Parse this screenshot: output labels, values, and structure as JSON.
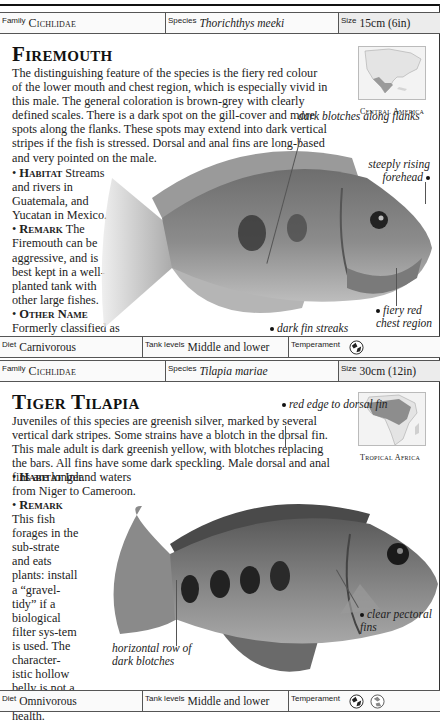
{
  "entries": [
    {
      "family_label": "Family",
      "family": "Cichlidae",
      "species_label": "Species",
      "species": "Thorichthys meeki",
      "size_label": "Size",
      "size": "15cm (6in)",
      "title": "Firemouth",
      "description": "The distinguishing feature of the species is the fiery red colour of the lower mouth and chest region, which is especially vivid in this male. The general coloration is brown-grey with clearly defined scales. There is a dark spot on the gill-cover and more spots along the flanks. These spots may extend into dark vertical stripes if the fish is stressed. Dorsal and anal fins are long-based and very pointed on the male.",
      "habitat_key": "Habitat",
      "habitat": "Streams and rivers in Guatemala, and Yucatan in Mexico.",
      "remark_key": "Remark",
      "remark": "The Firemouth can be aggressive, and is best kept in a well-planted tank with other large fishes.",
      "other_key": "Other Name",
      "other_text": "Formerly classified as",
      "other_name": "Cichlasoma meeki.",
      "map_region": "Central America",
      "callouts": [
        "dark blotches along flanks",
        "steeply rising forehead",
        "fiery red chest region",
        "dark fin streaks"
      ],
      "diet_label": "Diet",
      "diet": "Carnivorous",
      "tank_label": "Tank levels",
      "tank": "Middle and lower",
      "temperament_label": "Temperament",
      "temperament_icons": [
        "aggressive-fish-icon"
      ]
    },
    {
      "family_label": "Family",
      "family": "Cichlidae",
      "species_label": "Species",
      "species": "Tilapia mariae",
      "size_label": "Size",
      "size": "30cm (12in)",
      "title": "Tiger Tilapia",
      "description": "Juveniles of this species are greenish silver, marked by several vertical dark stripes. Some strains have a blotch in the dorsal fin. This male adult is dark greenish yellow, with blotches replacing the bars. All fins have some dark speckling. Male dorsal and anal fins are longer.",
      "habitat_key": "Habitat",
      "habitat": "Inland waters from Niger to Cameroon.",
      "remark_key": "Remark",
      "remark": "This fish forages in the sub-strate and eats plants: install a “gravel-tidy” if a biological filter sys-tem is used. The character-istic hollow belly is not a sign of poor health.",
      "map_region": "Tropical Africa",
      "callouts": [
        "red edge to dorsal fin",
        "clear pectoral fins",
        "horizontal row of dark blotches"
      ],
      "diet_label": "Diet",
      "diet": "Omnivorous",
      "tank_label": "Tank levels",
      "tank": "Middle and lower",
      "temperament_label": "Temperament",
      "temperament_icons": [
        "aggressive-fish-icon",
        "territorial-fish-icon"
      ]
    }
  ]
}
